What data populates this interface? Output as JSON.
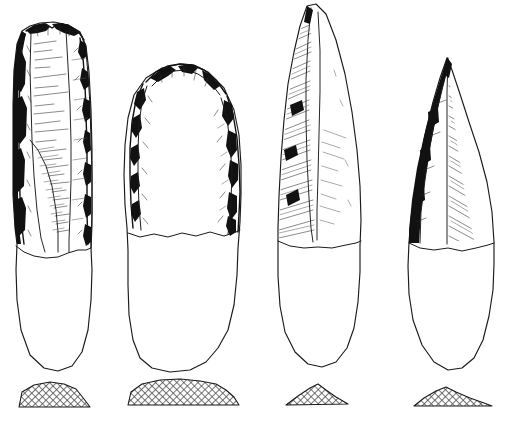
{
  "plate": {
    "title": "Lithic artefact plate",
    "description": "Archaeological line drawing of four retouched stone tools shown in plan view with transverse cross-sections below each",
    "background_color": "#ffffff",
    "ink_color": "#1a1a1a",
    "width": 505,
    "height": 423,
    "figure_count": 4
  },
  "render": {
    "hatch_fill_color": "#6b6b6b",
    "shadow_ink_color": "#111111",
    "line_width": 1.15
  },
  "figures": [
    {
      "id": "artifact-1",
      "label": "1",
      "type": "retouched-blade",
      "description": "Elongated blade with continuous steep retouch along both lateral edges; rounded unworked base",
      "bbox": {
        "x": 8,
        "y": 22,
        "width": 86,
        "height": 350
      },
      "tip_shape": "blunt-rounded",
      "base_shape": "rounded",
      "retouch_edges": [
        "left",
        "right"
      ],
      "division_y": 243,
      "section": {
        "id": "section-1",
        "shape": "plano-convex-trapezoid",
        "bbox": {
          "x": 18,
          "y": 381,
          "width": 75,
          "height": 27
        },
        "peak_offset": 0.45
      }
    },
    {
      "id": "artifact-2",
      "label": "2",
      "type": "domed-scraper",
      "description": "Broad tool with a domed distal end worked by scalar retouch on both edges; wide plain proximal body",
      "bbox": {
        "x": 124,
        "y": 63,
        "width": 118,
        "height": 310
      },
      "tip_shape": "domed",
      "base_shape": "rounded-square",
      "retouch_edges": [
        "left",
        "right",
        "distal"
      ],
      "division_y": 233,
      "section": {
        "id": "section-2",
        "shape": "wide-plano-convex",
        "bbox": {
          "x": 126,
          "y": 379,
          "width": 114,
          "height": 27
        },
        "peak_offset": 0.5
      }
    },
    {
      "id": "artifact-3",
      "label": "3",
      "type": "pointed-blade",
      "description": "Narrow pointed blade with a single long lateral facet heavily hatched on the left side; rounded base",
      "bbox": {
        "x": 277,
        "y": 5,
        "width": 84,
        "height": 365
      },
      "tip_shape": "pointed",
      "base_shape": "rounded",
      "retouch_edges": [
        "left"
      ],
      "division_y": 240,
      "section": {
        "id": "section-3",
        "shape": "low-triangular",
        "bbox": {
          "x": 286,
          "y": 383,
          "width": 62,
          "height": 23
        },
        "peak_offset": 0.52
      }
    },
    {
      "id": "artifact-4",
      "label": "4",
      "type": "pointed-blade",
      "description": "Slender asymmetric point with dark narrow facet on the left edge and fan hatching from the median ridge; rounded base",
      "bbox": {
        "x": 407,
        "y": 57,
        "width": 88,
        "height": 315
      },
      "tip_shape": "sharp-point",
      "base_shape": "rounded",
      "retouch_edges": [
        "left"
      ],
      "division_y": 245,
      "section": {
        "id": "section-4",
        "shape": "asymmetric-low-triangular",
        "bbox": {
          "x": 413,
          "y": 387,
          "width": 80,
          "height": 21
        },
        "peak_offset": 0.38
      }
    }
  ]
}
